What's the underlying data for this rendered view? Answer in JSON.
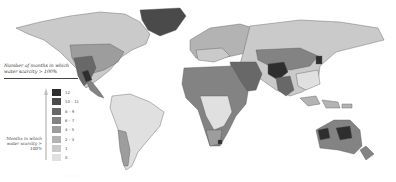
{
  "map": {
    "subject": "Global water scarcity by number of months per year",
    "legend": {
      "title": "Number of months in which water scarcity > 100%",
      "arrow_label": "Months in which water scarcity > 100%",
      "items": [
        {
          "label": "12",
          "color": "#2e2e2e"
        },
        {
          "label": "10 – 11",
          "color": "#4a4a4a"
        },
        {
          "label": "8 – 9",
          "color": "#686868"
        },
        {
          "label": "6 – 7",
          "color": "#838383"
        },
        {
          "label": "4 – 5",
          "color": "#9d9d9d"
        },
        {
          "label": "2 – 3",
          "color": "#b3b3b3"
        },
        {
          "label": "1",
          "color": "#cacaca"
        },
        {
          "label": "0",
          "color": "#e0e0e0"
        }
      ]
    },
    "footnote": "· · · · · · · · · · ·"
  }
}
